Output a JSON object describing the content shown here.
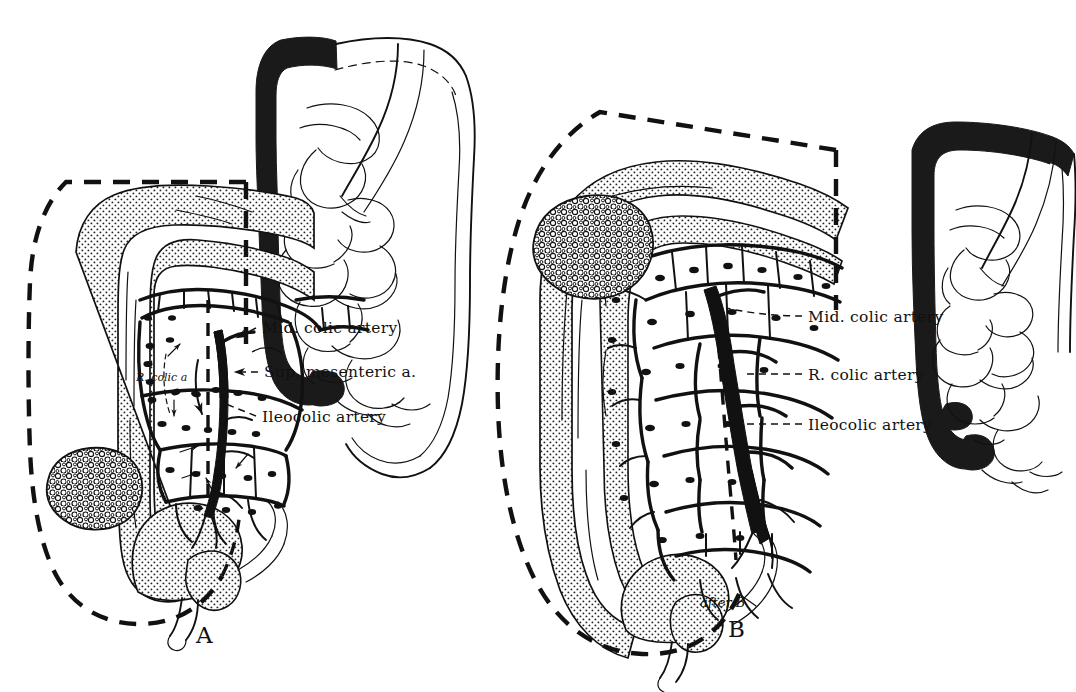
{
  "figure": {
    "background": "#ffffff",
    "ink_color": "#111111",
    "width": 1076,
    "height": 692
  },
  "panels": [
    {
      "id": "panel-a",
      "letter": "A",
      "letter_pos": {
        "x": 196,
        "y": 643
      },
      "inset": {
        "name": "colon-inset-a",
        "description": "small bowel and colon schematic, right colon blackened",
        "x": 258,
        "y": 28,
        "w": 215,
        "h": 160
      },
      "labels": [
        {
          "id": "a-mid-colic",
          "text": "Mid. colic artery",
          "x": 262,
          "y": 332,
          "leader": {
            "from": [
              256,
              329
            ],
            "to": [
              238,
              338
            ],
            "arrow": true
          }
        },
        {
          "id": "a-sup-mesenteric",
          "text": "Sup. mesenteric a.",
          "x": 262,
          "y": 375,
          "leader": {
            "from": [
              256,
              370
            ],
            "to": [
              232,
              370
            ],
            "arrow": true
          }
        },
        {
          "id": "a-ileocolic",
          "text": "Ileocolic artery",
          "x": 262,
          "y": 421,
          "leader": {
            "from": [
              256,
              416
            ],
            "to": [
              228,
              408
            ],
            "arrow": false
          }
        }
      ],
      "inline_labels": [
        {
          "id": "a-r-colic",
          "text": "R. colic a",
          "x": 137,
          "y": 379
        }
      ]
    },
    {
      "id": "panel-b",
      "letter": "B",
      "letter_pos": {
        "x": 728,
        "y": 637
      },
      "inset": {
        "name": "colon-inset-b",
        "description": "small bowel and colon schematic, right and transverse colon blackened",
        "x": 888,
        "y": 112,
        "w": 190,
        "h": 180
      },
      "labels": [
        {
          "id": "b-mid-colic",
          "text": "Mid. colic artery",
          "x": 808,
          "y": 322,
          "leader": {
            "from": [
              802,
              317
            ],
            "to": [
              724,
              310
            ],
            "arrow": false
          }
        },
        {
          "id": "b-r-colic",
          "text": "R. colic artery",
          "x": 808,
          "y": 380,
          "leader": {
            "from": [
              802,
              375
            ],
            "to": [
              740,
              375
            ],
            "arrow": false
          }
        },
        {
          "id": "b-ileocolic",
          "text": "Ileocolic artery",
          "x": 808,
          "y": 430,
          "leader": {
            "from": [
              802,
              425
            ],
            "to": [
              726,
              425
            ],
            "arrow": true
          }
        }
      ],
      "annotations": [
        {
          "id": "b-after-credit",
          "text": "after B",
          "x": 727,
          "y": 605,
          "struck": true
        }
      ]
    }
  ],
  "legend_terms": [
    "Mid. colic artery",
    "Sup. mesenteric a.",
    "Ileocolic artery",
    "R. colic artery",
    "R. colic a"
  ]
}
